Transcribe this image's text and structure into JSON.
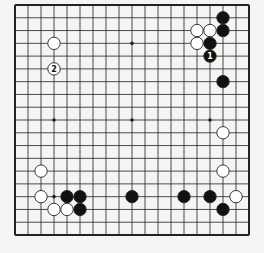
{
  "diagram": {
    "type": "go-board",
    "size": 19,
    "colors": {
      "background": "#f4f4f2",
      "line": "#222222",
      "black": "#111111",
      "white": "#ffffff"
    },
    "star_points": [
      [
        3,
        3
      ],
      [
        9,
        3
      ],
      [
        15,
        3
      ],
      [
        3,
        9
      ],
      [
        9,
        9
      ],
      [
        15,
        9
      ],
      [
        3,
        15
      ],
      [
        9,
        15
      ],
      [
        15,
        15
      ]
    ],
    "stones": [
      {
        "color": "white",
        "col": 3,
        "row": 3
      },
      {
        "color": "white",
        "col": 3,
        "row": 5,
        "label": "2"
      },
      {
        "color": "black",
        "col": 16,
        "row": 1
      },
      {
        "color": "black",
        "col": 16,
        "row": 2
      },
      {
        "color": "white",
        "col": 14,
        "row": 2
      },
      {
        "color": "white",
        "col": 15,
        "row": 2
      },
      {
        "color": "white",
        "col": 14,
        "row": 3
      },
      {
        "color": "black",
        "col": 15,
        "row": 3
      },
      {
        "color": "black",
        "col": 15,
        "row": 4,
        "label": "1"
      },
      {
        "color": "black",
        "col": 16,
        "row": 6
      },
      {
        "color": "white",
        "col": 16,
        "row": 10
      },
      {
        "color": "white",
        "col": 16,
        "row": 13
      },
      {
        "color": "white",
        "col": 2,
        "row": 13
      },
      {
        "color": "white",
        "col": 2,
        "row": 15
      },
      {
        "color": "black",
        "col": 4,
        "row": 15
      },
      {
        "color": "black",
        "col": 5,
        "row": 15
      },
      {
        "color": "white",
        "col": 3,
        "row": 16
      },
      {
        "color": "white",
        "col": 4,
        "row": 16
      },
      {
        "color": "black",
        "col": 5,
        "row": 16
      },
      {
        "color": "black",
        "col": 9,
        "row": 15
      },
      {
        "color": "black",
        "col": 13,
        "row": 15
      },
      {
        "color": "black",
        "col": 15,
        "row": 15
      },
      {
        "color": "white",
        "col": 17,
        "row": 15
      },
      {
        "color": "black",
        "col": 16,
        "row": 16
      }
    ]
  }
}
